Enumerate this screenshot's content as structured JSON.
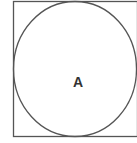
{
  "diagram": {
    "type": "circle-inscribed-in-square",
    "stroke_color": "#555555",
    "square": {
      "x": 13.5,
      "y": 1.5,
      "width": 124,
      "height": 135
    },
    "circle": {
      "cx": 75,
      "cy": 69,
      "rx": 61.5,
      "ry": 67.5
    },
    "region_label": {
      "text": "A",
      "x": 78,
      "y": 87
    }
  }
}
